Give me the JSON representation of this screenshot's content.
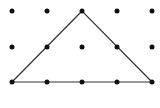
{
  "diagram": {
    "type": "dot-grid-triangle",
    "grid": {
      "columns": 5,
      "rows": 3,
      "x_positions": [
        12,
        47,
        82,
        117,
        152
      ],
      "y_positions": [
        11,
        47,
        82
      ],
      "dot_radius": 2.5,
      "dot_color": "#111111"
    },
    "triangle": {
      "vertices": [
        [
          82,
          11
        ],
        [
          12,
          82
        ],
        [
          152,
          82
        ]
      ],
      "stroke_color": "#333333",
      "stroke_width": 1.2
    },
    "background": "#ffffff"
  }
}
